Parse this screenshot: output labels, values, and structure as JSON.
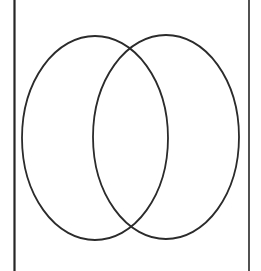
{
  "figure": {
    "type": "line-diagram",
    "width": 261,
    "height": 271,
    "background_color": "#ffffff",
    "stroke_color": "#2b2b2b",
    "rule_color": "#262626"
  },
  "shapes": {
    "left_ellipse": {
      "name": "left-ellipse",
      "cx": 95,
      "cy": 138,
      "rx": 73,
      "ry": 102,
      "stroke_width": 1.8,
      "stroke_color": "#2b2b2b",
      "fill": "none"
    },
    "right_ellipse": {
      "name": "right-ellipse",
      "cx": 166,
      "cy": 137,
      "rx": 73,
      "ry": 102,
      "stroke_width": 1.8,
      "stroke_color": "#2b2b2b",
      "fill": "none"
    },
    "left_rule": {
      "name": "left-vertical-rule",
      "x": 14.5,
      "y1": 0,
      "y2": 271,
      "stroke_width": 2.2,
      "stroke_color": "#262626"
    },
    "right_rule": {
      "name": "right-vertical-rule",
      "x": 249,
      "y1": 0,
      "y2": 271,
      "stroke_width": 1.6,
      "stroke_color": "#262626"
    }
  },
  "chart_data": {
    "type": "scatter",
    "xlabel": "",
    "ylabel": "",
    "xlim": [
      0,
      261
    ],
    "ylim": [
      0,
      271
    ],
    "grid": false,
    "legend": "none",
    "series": [
      {
        "name": "left-ellipse",
        "shape": "ellipse",
        "center": [
          95,
          138
        ],
        "radii": [
          73,
          102
        ],
        "extent_x": [
          22,
          168
        ],
        "extent_y": [
          36,
          240
        ]
      },
      {
        "name": "right-ellipse",
        "shape": "ellipse",
        "center": [
          166,
          137
        ],
        "radii": [
          73,
          102
        ],
        "extent_x": [
          93,
          239
        ],
        "extent_y": [
          35,
          239
        ]
      },
      {
        "name": "left-vertical-rule",
        "shape": "line",
        "x": [
          14.5,
          14.5
        ],
        "y": [
          0,
          271
        ]
      },
      {
        "name": "right-vertical-rule",
        "shape": "line",
        "x": [
          249,
          249
        ],
        "y": [
          0,
          271
        ]
      }
    ],
    "annotations": [
      {
        "name": "upper-intersection",
        "x": 135,
        "y": 50
      },
      {
        "name": "lower-intersection",
        "x": 137,
        "y": 228
      }
    ]
  }
}
